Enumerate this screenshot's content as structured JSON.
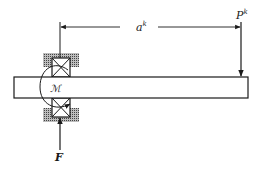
{
  "diagram": {
    "type": "beam-with-bearing-support",
    "labels": {
      "load": "P",
      "load_superscript": "k",
      "distance": "a",
      "distance_superscript": "k",
      "moment": "ℳ",
      "reaction": "F"
    },
    "colors": {
      "line": "#1a1a1a",
      "hatch": "#555555",
      "background": "#ffffff"
    }
  }
}
